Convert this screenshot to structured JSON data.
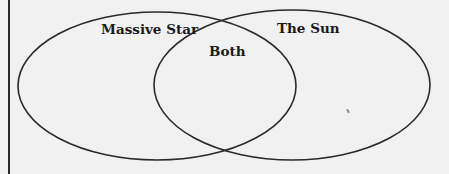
{
  "diagram": {
    "type": "venn",
    "sets": [
      {
        "id": "left",
        "label": "Massive Star"
      },
      {
        "id": "right",
        "label": "The Sun"
      }
    ],
    "intersection": {
      "label": "Both"
    },
    "colors": {
      "background": "#f1f1f1",
      "stroke": "#2a2a2a",
      "text": "#1a1a1a"
    }
  }
}
